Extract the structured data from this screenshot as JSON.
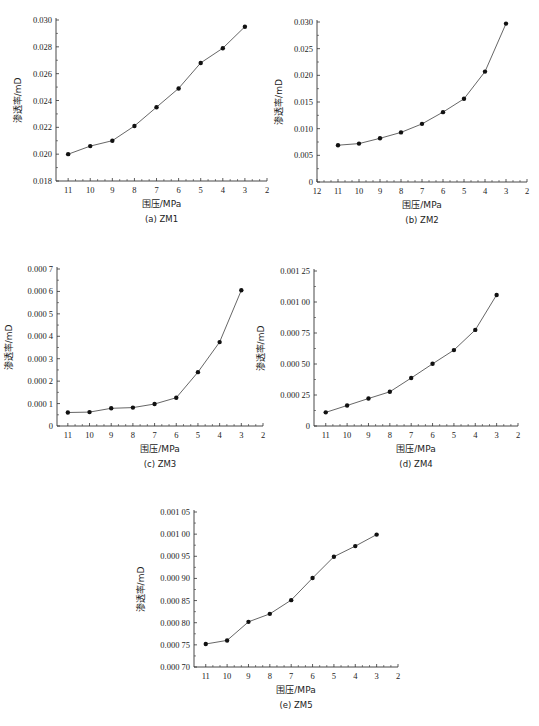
{
  "chart_data": [
    {
      "id": "a",
      "type": "line",
      "caption": "(a) ZM1",
      "xlabel": "围压/MPa",
      "ylabel": "渗透率/mD",
      "x": [
        11,
        10,
        9,
        8,
        7,
        6,
        5,
        4,
        3
      ],
      "values": [
        0.02,
        0.0206,
        0.021,
        0.0221,
        0.0235,
        0.0249,
        0.0268,
        0.0279,
        0.0295
      ],
      "xlim": [
        11.5,
        2
      ],
      "xticks": [
        11,
        10,
        9,
        8,
        7,
        6,
        5,
        4,
        3,
        2
      ],
      "ylim": [
        0.018,
        0.03
      ],
      "yticks": [
        0.018,
        0.02,
        0.022,
        0.024,
        0.026,
        0.028,
        0.03
      ],
      "ytick_labels": [
        "0.018",
        "0.020",
        "0.022",
        "0.024",
        "0.026",
        "0.028",
        "0.030"
      ],
      "grid": false,
      "legend": null,
      "frame": {
        "x0": 56,
        "x1": 267,
        "y0": 20,
        "y1": 181,
        "xleft_val": 11.55,
        "xright_val": 2
      }
    },
    {
      "id": "b",
      "type": "line",
      "caption": "(b) ZM2",
      "xlabel": "围压/MPa",
      "ylabel": "渗透率/mD",
      "x": [
        11,
        10,
        9,
        8,
        7,
        6,
        5,
        4,
        3
      ],
      "values": [
        0.0069,
        0.0072,
        0.0082,
        0.0093,
        0.0109,
        0.0131,
        0.0156,
        0.0207,
        0.0297
      ],
      "xlim": [
        12,
        2
      ],
      "xticks": [
        12,
        11,
        10,
        9,
        8,
        7,
        6,
        5,
        4,
        3,
        2
      ],
      "ylim": [
        0,
        0.03
      ],
      "yticks": [
        0,
        0.005,
        0.01,
        0.015,
        0.02,
        0.025,
        0.03
      ],
      "ytick_labels": [
        "0",
        "0.005",
        "0.010",
        "0.015",
        "0.020",
        "0.025",
        "0.030"
      ],
      "grid": false,
      "legend": null,
      "frame": {
        "x0": 317,
        "x1": 527,
        "y0": 22,
        "y1": 182,
        "xleft_val": 12,
        "xright_val": 2
      }
    },
    {
      "id": "c",
      "type": "line",
      "caption": "(c) ZM3",
      "xlabel": "围压/MPa",
      "ylabel": "渗透率/mD",
      "x": [
        11,
        10,
        9,
        8,
        7,
        6,
        5,
        4,
        3
      ],
      "values": [
        6e-05,
        6.2e-05,
        7.9e-05,
        8.2e-05,
        9.8e-05,
        0.000126,
        0.00024,
        0.000374,
        0.000605
      ],
      "xlim": [
        11.5,
        2
      ],
      "xticks": [
        11,
        10,
        9,
        8,
        7,
        6,
        5,
        4,
        3,
        2
      ],
      "ylim": [
        0,
        0.0007
      ],
      "yticks": [
        0,
        0.0001,
        0.0002,
        0.0003,
        0.0004,
        0.0005,
        0.0006,
        0.0007
      ],
      "ytick_labels": [
        "0",
        "0.000 1",
        "0.000 2",
        "0.000 3",
        "0.000 4",
        "0.000 5",
        "0.000 6",
        "0.000 7"
      ],
      "grid": false,
      "legend": null,
      "frame": {
        "x0": 57,
        "x1": 263,
        "y0": 269,
        "y1": 426,
        "xleft_val": 11.5,
        "xright_val": 2
      }
    },
    {
      "id": "d",
      "type": "line",
      "caption": "(d) ZM4",
      "xlabel": "围压/MPa",
      "ylabel": "渗透率/mD",
      "x": [
        11,
        10,
        9,
        8,
        7,
        6,
        5,
        4,
        3
      ],
      "values": [
        0.00011,
        0.000165,
        0.000222,
        0.000276,
        0.000387,
        0.000502,
        0.000612,
        0.000775,
        0.001057
      ],
      "xlim": [
        11.5,
        2
      ],
      "xticks": [
        11,
        10,
        9,
        8,
        7,
        6,
        5,
        4,
        3,
        2
      ],
      "ylim": [
        0,
        0.00125
      ],
      "yticks": [
        0,
        0.00025,
        0.0005,
        0.00075,
        0.001,
        0.00125
      ],
      "ytick_labels": [
        "0",
        "0.000 25",
        "0.000 50",
        "0.000 75",
        "0.001 00",
        "0.001 25"
      ],
      "grid": false,
      "legend": null,
      "frame": {
        "x0": 314,
        "x1": 518,
        "y0": 271,
        "y1": 426,
        "xleft_val": 11.55,
        "xright_val": 2
      }
    },
    {
      "id": "e",
      "type": "line",
      "caption": "(e) ZM5",
      "xlabel": "围压/MPa",
      "ylabel": "渗透率/mD",
      "x": [
        11,
        10,
        9,
        8,
        7,
        6,
        5,
        4,
        3
      ],
      "values": [
        0.000752,
        0.00076,
        0.000802,
        0.00082,
        0.000851,
        0.000901,
        0.000949,
        0.000973,
        0.000999
      ],
      "xlim": [
        11.5,
        2
      ],
      "xticks": [
        11,
        10,
        9,
        8,
        7,
        6,
        5,
        4,
        3,
        2
      ],
      "ylim": [
        0.0007,
        0.00105
      ],
      "yticks": [
        0.0007,
        0.00075,
        0.0008,
        0.00085,
        0.0009,
        0.00095,
        0.001,
        0.00105
      ],
      "ytick_labels": [
        "0.000 70",
        "0.000 75",
        "0.000 80",
        "0.000 85",
        "0.000 90",
        "0.000 95",
        "0.001 00",
        "0.001 05"
      ],
      "grid": false,
      "legend": null,
      "frame": {
        "x0": 194,
        "x1": 398,
        "y0": 512,
        "y1": 667,
        "xleft_val": 11.55,
        "xright_val": 2
      }
    }
  ],
  "colors": {
    "line": "#555555",
    "marker": "#111111",
    "axis": "#333333",
    "text": "#222222"
  }
}
